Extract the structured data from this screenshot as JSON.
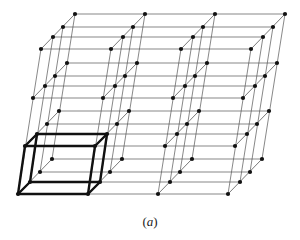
{
  "figure": {
    "caption_open": "(",
    "caption_letter": "a",
    "caption_close": ")",
    "colors": {
      "line": "#555555",
      "dot": "#111111",
      "highlight": "#111111",
      "background": "#ffffff"
    },
    "lattice": {
      "columns": 4,
      "levels": 4,
      "depths": 4,
      "column_step": 70,
      "level_y": [
        194,
        146,
        98,
        49
      ],
      "level_x0": [
        18,
        25,
        33,
        41
      ],
      "depth_offsets": [
        [
          0,
          0
        ],
        [
          12,
          -12
        ],
        [
          22,
          -22
        ],
        [
          34,
          -35
        ]
      ]
    },
    "highlighted_cell": {
      "column": 0,
      "level": 0,
      "depth": 0
    }
  }
}
